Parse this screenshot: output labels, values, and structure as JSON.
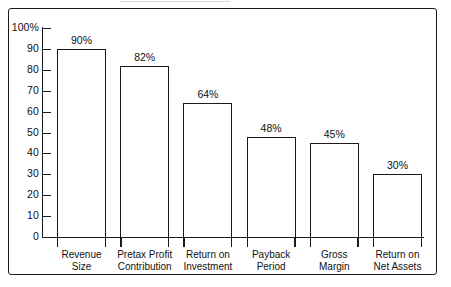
{
  "chart_data": {
    "type": "bar",
    "title": "",
    "subtitle": "",
    "xlabel": "",
    "ylabel": "",
    "ylim": [
      0,
      100
    ],
    "grid": false,
    "legend": "none",
    "categories": [
      "Revenue Size",
      "Pretax Profit Contribution",
      "Return on Investment",
      "Payback Period",
      "Gross Margin",
      "Return on Net Assets"
    ],
    "category_lines": [
      [
        "Revenue",
        "Size"
      ],
      [
        "Pretax Profit",
        "Contribution"
      ],
      [
        "Return on",
        "Investment"
      ],
      [
        "Payback",
        "Period"
      ],
      [
        "Gross",
        "Margin"
      ],
      [
        "Return on",
        "Net Assets"
      ]
    ],
    "values": [
      90,
      82,
      64,
      48,
      45,
      30
    ],
    "value_labels": [
      "90%",
      "82%",
      "64%",
      "48%",
      "45%",
      "30%"
    ],
    "y_ticks": [
      0,
      10,
      20,
      30,
      40,
      50,
      60,
      70,
      80,
      90,
      100
    ],
    "y_tick_labels": [
      "0",
      "10",
      "20",
      "30",
      "40",
      "50",
      "60",
      "70",
      "80",
      "90",
      "100%"
    ],
    "colors": {
      "bar_fill": "#ffffff",
      "bar_stroke": "#1b1b1b",
      "axis": "#1b1b1b",
      "text": "#111111",
      "background": "#ffffff",
      "frame": "#1b1b1b"
    }
  }
}
